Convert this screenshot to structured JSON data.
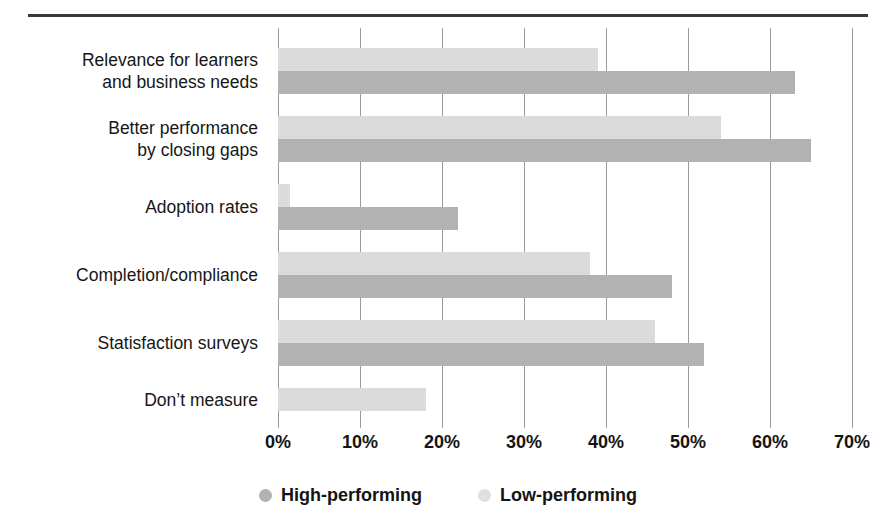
{
  "figure": {
    "title": "",
    "has_top_rule": true
  },
  "chart_data": {
    "type": "bar",
    "orientation": "horizontal",
    "title": "",
    "xlabel": "",
    "ylabel": "",
    "xlim": [
      0,
      70
    ],
    "xticks": [
      0,
      10,
      20,
      30,
      40,
      50,
      60,
      70
    ],
    "xtick_labels": [
      "0%",
      "10%",
      "20%",
      "30%",
      "40%",
      "50%",
      "60%",
      "70%"
    ],
    "grid": "vertical",
    "legend_position": "bottom-center",
    "categories": [
      "Relevance for learners\nand business needs",
      "Better performance\nby closing gaps",
      "Adoption rates",
      "Completion/compliance",
      "Statisfaction surveys",
      "Don’t measure"
    ],
    "series": [
      {
        "name": "Low-performing",
        "color": "#dbdbdb",
        "values": [
          39,
          54,
          1.5,
          38,
          46,
          18
        ]
      },
      {
        "name": "High-performing",
        "color": "#b2b2b2",
        "values": [
          63,
          65,
          22,
          48,
          52,
          0
        ]
      }
    ]
  },
  "legend": {
    "items": [
      {
        "label": "High-performing",
        "marker": "circle-dark",
        "color": "#b2b2b2"
      },
      {
        "label": "Low-performing",
        "marker": "circle-light",
        "color": "#e0e0e0"
      }
    ]
  }
}
